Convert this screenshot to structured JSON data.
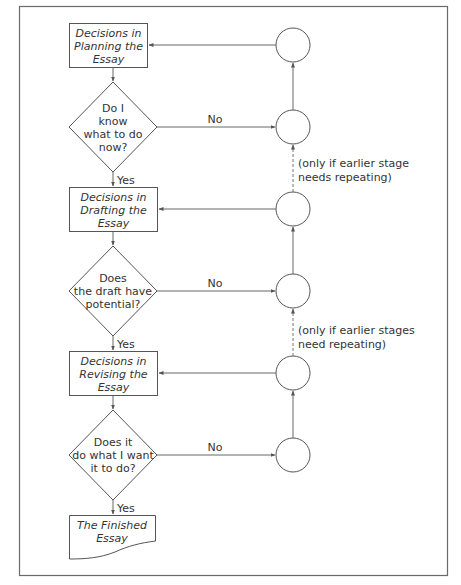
{
  "diagram": {
    "boxes": [
      {
        "id": "planning",
        "lines": [
          "Decisions in",
          "Planning the",
          "Essay"
        ]
      },
      {
        "id": "drafting",
        "lines": [
          "Decisions in",
          "Drafting the",
          "Essay"
        ]
      },
      {
        "id": "revising",
        "lines": [
          "Decisions in",
          "Revising the",
          "Essay"
        ]
      }
    ],
    "decisions": [
      {
        "id": "know-what-to-do",
        "lines": [
          "Do I",
          "know",
          "what to do",
          "now?"
        ]
      },
      {
        "id": "draft-potential",
        "lines": [
          "Does",
          "the draft have",
          "potential?"
        ]
      },
      {
        "id": "does-what-i-want",
        "lines": [
          "Does it",
          "do what I want",
          "it to do?"
        ]
      }
    ],
    "terminal": {
      "id": "finished",
      "lines": [
        "The Finished",
        "Essay"
      ]
    },
    "edge_labels": {
      "yes": "Yes",
      "no": "No"
    },
    "notes": [
      {
        "lines": [
          "(only if earlier stage",
          "needs repeating)"
        ]
      },
      {
        "lines": [
          "(only if earlier stages",
          "need repeating)"
        ]
      }
    ],
    "colors": {
      "stroke": "#555555",
      "text": "#333333",
      "background": "#ffffff"
    }
  }
}
